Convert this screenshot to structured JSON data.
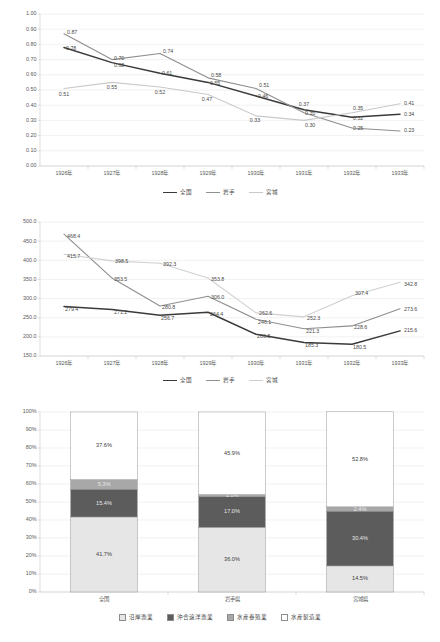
{
  "chart_data": [
    {
      "id": "chart1",
      "type": "line",
      "title": "",
      "xlabel": "",
      "ylabel": "",
      "categories": [
        "1926年",
        "1927年",
        "1928年",
        "1929年",
        "1930年",
        "1931年",
        "1932年",
        "1933年"
      ],
      "ylim": [
        0.0,
        1.0
      ],
      "ytick_step": 0.1,
      "ytick_labels": [
        "0.00",
        "0.10",
        "0.20",
        "0.30",
        "0.40",
        "0.50",
        "0.60",
        "0.70",
        "0.80",
        "0.90",
        "1.00"
      ],
      "grid": true,
      "legend_position": "bottom",
      "series": [
        {
          "name": "全国",
          "color": "#3a3a3a",
          "width": 1.5,
          "values": [
            0.78,
            0.68,
            0.61,
            0.55,
            0.46,
            0.37,
            0.32,
            0.34
          ],
          "labels": [
            "0.78",
            "0.68",
            "0.61",
            "0.55",
            "0.46",
            "0.37",
            "0.32",
            "0.34"
          ]
        },
        {
          "name": "岩手",
          "color": "#8f8f8f",
          "width": 1.1,
          "values": [
            0.87,
            0.7,
            0.74,
            0.58,
            0.51,
            0.35,
            0.25,
            0.23
          ],
          "labels": [
            "0.87",
            "0.70",
            "0.74",
            "0.58",
            "0.51",
            "0.35",
            "0.25",
            "0.23"
          ]
        },
        {
          "name": "宮城",
          "color": "#c9c9c9",
          "width": 1.1,
          "values": [
            0.51,
            0.55,
            0.52,
            0.47,
            0.33,
            0.3,
            0.35,
            0.41
          ],
          "labels": [
            "0.51",
            "0.55",
            "0.52",
            "0.47",
            "0.33",
            "0.30",
            "0.35",
            "0.41"
          ]
        }
      ]
    },
    {
      "id": "chart2",
      "type": "line",
      "title": "",
      "xlabel": "",
      "ylabel": "",
      "categories": [
        "1926年",
        "1927年",
        "1928年",
        "1929年",
        "1930年",
        "1931年",
        "1932年",
        "1933年"
      ],
      "ylim": [
        150.0,
        500.0
      ],
      "ytick_step": 50.0,
      "ytick_labels": [
        "150.0",
        "200.0",
        "250.0",
        "300.0",
        "350.0",
        "400.0",
        "450.0",
        "500.0"
      ],
      "grid": true,
      "legend_position": "bottom",
      "series": [
        {
          "name": "全国",
          "color": "#3a3a3a",
          "width": 1.5,
          "values": [
            279.4,
            271.2,
            256.7,
            264.4,
            206.8,
            185.3,
            180.5,
            215.6
          ],
          "labels": [
            "279.4",
            "271.2",
            "256.7",
            "264.4",
            "206.8",
            "185.3",
            "180.5",
            "215.6"
          ]
        },
        {
          "name": "岩手",
          "color": "#8f8f8f",
          "width": 1.1,
          "values": [
            468.4,
            353.5,
            280.8,
            306.0,
            246.1,
            221.3,
            228.6,
            273.6
          ],
          "labels": [
            "468.4",
            "353.5",
            "280.8",
            "306.0",
            "246.1",
            "221.3",
            "228.6",
            "273.6"
          ]
        },
        {
          "name": "宮城",
          "color": "#d0d0d0",
          "width": 1.1,
          "values": [
            415.7,
            398.5,
            392.3,
            353.8,
            262.6,
            252.3,
            307.4,
            342.8
          ],
          "labels": [
            "415.7",
            "398.5",
            "392.3",
            "353.8",
            "262.6",
            "252.3",
            "307.4",
            "342.8"
          ]
        }
      ]
    },
    {
      "id": "chart3",
      "type": "bar",
      "stacked": true,
      "title": "",
      "xlabel": "",
      "ylabel": "",
      "categories": [
        "全国",
        "岩手県",
        "宮城県"
      ],
      "ylim": [
        0,
        100
      ],
      "ytick_step": 10,
      "ytick_labels": [
        "0%",
        "10%",
        "20%",
        "30%",
        "40%",
        "50%",
        "60%",
        "70%",
        "80%",
        "90%",
        "100%"
      ],
      "grid": true,
      "legend_position": "bottom",
      "series": [
        {
          "name": "沿岸漁業",
          "color": "#e6e6e6",
          "values": [
            41.7,
            36.0,
            14.5
          ],
          "labels": [
            "41.7%",
            "36.0%",
            "14.5%"
          ],
          "label_on_dark": false
        },
        {
          "name": "沖合遠洋漁業",
          "color": "#5c5c5c",
          "values": [
            15.4,
            17.0,
            30.4
          ],
          "labels": [
            "15.4%",
            "17.0%",
            "30.4%"
          ],
          "label_on_dark": true
        },
        {
          "name": "水産養殖業",
          "color": "#a8a8a8",
          "values": [
            5.3,
            1.1,
            2.4
          ],
          "labels": [
            "5.3%",
            "1.1%",
            "2.4%"
          ],
          "label_on_dark": true
        },
        {
          "name": "水産製造業",
          "color": "#ffffff",
          "values": [
            37.6,
            45.9,
            52.8
          ],
          "labels": [
            "37.6%",
            "45.9%",
            "52.8%"
          ],
          "label_on_dark": false
        }
      ]
    }
  ]
}
